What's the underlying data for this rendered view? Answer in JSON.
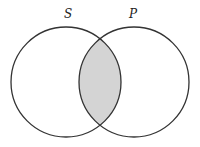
{
  "diagram": {
    "type": "venn",
    "sets": [
      {
        "label": "S",
        "cx": 66,
        "cy": 82,
        "r": 55
      },
      {
        "label": "P",
        "cx": 134,
        "cy": 82,
        "r": 55
      }
    ],
    "shaded_region": "S ∩ P",
    "colors": {
      "stroke": "#333333",
      "shade": "#d4d4d4",
      "background": "#ffffff"
    }
  }
}
